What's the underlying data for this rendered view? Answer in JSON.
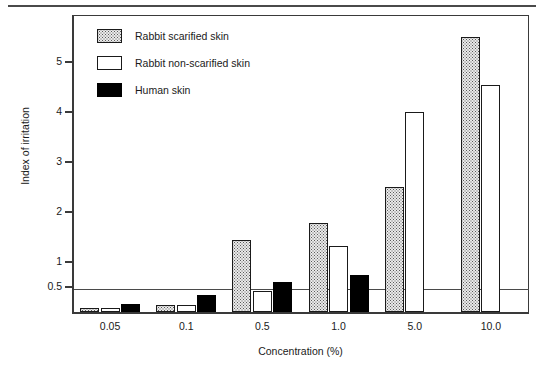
{
  "chart_data": {
    "type": "bar",
    "title": "",
    "xlabel": "Concentration (%)",
    "ylabel": "Index of irritation",
    "categories": [
      "0.05",
      "0.1",
      "0.5",
      "1.0",
      "5.0",
      "10.0"
    ],
    "series": [
      {
        "name": "Rabbit scarified skin",
        "fill": "dotted",
        "values": [
          0.08,
          0.14,
          1.45,
          1.78,
          2.5,
          5.5
        ]
      },
      {
        "name": "Rabbit non-scarified skin",
        "fill": "white",
        "values": [
          0.08,
          0.14,
          0.43,
          1.33,
          4.0,
          4.55
        ]
      },
      {
        "name": "Human skin",
        "fill": "black",
        "values": [
          0.16,
          0.35,
          0.6,
          0.75,
          0,
          0
        ]
      }
    ],
    "yticks": [
      0.5,
      1,
      2,
      3,
      4,
      5
    ],
    "ytick_labels": [
      "0.5",
      "1",
      "2",
      "3",
      "4",
      "5"
    ],
    "ylim": [
      0,
      6.0
    ],
    "reference_line": 0.5,
    "grid": false,
    "legend_position": "top-left"
  },
  "axes": {
    "y_title": "Index of irritation",
    "x_title": "Concentration (%)",
    "y_tick_labels": [
      "5",
      "4",
      "3",
      "2",
      "1",
      "0.5"
    ],
    "x_tick_labels": [
      "0.05",
      "0.1",
      "0.5",
      "1.0",
      "5.0",
      "10.0"
    ]
  },
  "legend": {
    "items": [
      {
        "label": "Rabbit scarified skin",
        "fill": "dotted"
      },
      {
        "label": "Rabbit non-scarified skin",
        "fill": "white"
      },
      {
        "label": "Human skin",
        "fill": "black"
      }
    ]
  },
  "colors": {
    "frame": "#3a3a3a",
    "bar_outline": "#1a1a1a",
    "black_fill": "#000000",
    "white_fill": "#ffffff",
    "dotted_fill": "#eaeaea",
    "reference_line": "#4a4a4a",
    "text": "#1a1a1a"
  }
}
